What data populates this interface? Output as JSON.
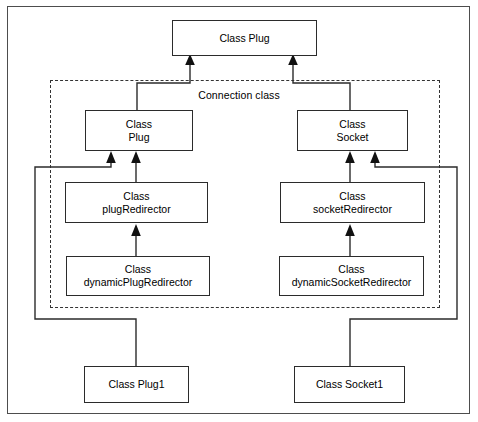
{
  "diagram": {
    "group": {
      "label": "Connection class",
      "style": "dashed"
    },
    "nodes": [
      {
        "id": "plug-top",
        "lines": [
          "Class Plug"
        ]
      },
      {
        "id": "plug-connection",
        "lines": [
          "Class",
          "Plug"
        ]
      },
      {
        "id": "socket-connection",
        "lines": [
          "Class",
          "Socket"
        ]
      },
      {
        "id": "plug-redirector",
        "lines": [
          "Class",
          "plugRedirector"
        ]
      },
      {
        "id": "socket-redirector",
        "lines": [
          "Class",
          "socketRedirector"
        ]
      },
      {
        "id": "dynamic-plug-redirector",
        "lines": [
          "Class",
          "dynamicPlugRedirector"
        ]
      },
      {
        "id": "dynamic-socket-redirector",
        "lines": [
          "Class",
          "dynamicSocketRedirector"
        ]
      },
      {
        "id": "plug1",
        "lines": [
          "Class Plug1"
        ]
      },
      {
        "id": "socket1",
        "lines": [
          "Class Socket1"
        ]
      }
    ],
    "edges": [
      {
        "from": "plug-connection",
        "to": "plug-top",
        "type": "generalization"
      },
      {
        "from": "socket-connection",
        "to": "plug-top",
        "type": "generalization"
      },
      {
        "from": "plug-redirector",
        "to": "plug-connection",
        "type": "generalization"
      },
      {
        "from": "plug1",
        "to": "plug-connection",
        "type": "generalization"
      },
      {
        "from": "socket-redirector",
        "to": "socket-connection",
        "type": "generalization"
      },
      {
        "from": "socket1",
        "to": "socket-connection",
        "type": "generalization"
      },
      {
        "from": "dynamic-plug-redirector",
        "to": "plug-redirector",
        "type": "generalization"
      },
      {
        "from": "dynamic-socket-redirector",
        "to": "socket-redirector",
        "type": "generalization"
      }
    ],
    "colors": {
      "frame": "#4d4d4d",
      "node_border": "#2b2b2b",
      "node_fill": "#ffffff",
      "connector": "#2b2b2b",
      "group_border": "#333333",
      "text": "#000000"
    }
  }
}
